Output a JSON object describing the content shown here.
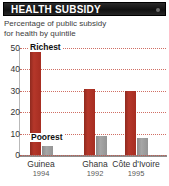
{
  "header": {
    "title": "HEALTH SUBSIDY",
    "dot_icon": "menu-dot-icon",
    "background_color": "#111111",
    "text_color": "#ffffff"
  },
  "subtitle": {
    "line1": "Percentage of public subsidy",
    "line2": "for health by quintile"
  },
  "colors": {
    "richest_bar": "#ab2f22",
    "poorest_bar": "#9b9b9b",
    "gridline": "#c8564a",
    "baseline": "#8e8e8e"
  },
  "chart_data": {
    "type": "bar",
    "title": "HEALTH SUBSIDY",
    "subtitle": "Percentage of public subsidy for health by quintile",
    "xlabel": "",
    "ylabel": "",
    "ylim": [
      0,
      50
    ],
    "yticks": [
      0,
      10,
      20,
      30,
      40,
      50
    ],
    "ytick_labels": [
      "0",
      "10",
      "20",
      "30",
      "40",
      "50"
    ],
    "grid": true,
    "grid_axis": "y",
    "legend_position": "in-plot-callouts",
    "categories": [
      "Guinea",
      "Ghana",
      "Côte d'Ivoire"
    ],
    "category_years": [
      "1994",
      "1992",
      "1995"
    ],
    "series": [
      {
        "name": "Richest",
        "color": "#ab2f22",
        "values": [
          48,
          31,
          30
        ]
      },
      {
        "name": "Poorest",
        "color": "#9b9b9b",
        "values": [
          4,
          9,
          8
        ]
      }
    ],
    "annotations": [
      {
        "text": "Richest",
        "target_series": "Richest",
        "target_category": "Guinea"
      },
      {
        "text": "Poorest",
        "target_series": "Poorest",
        "target_category": "Guinea"
      }
    ]
  }
}
